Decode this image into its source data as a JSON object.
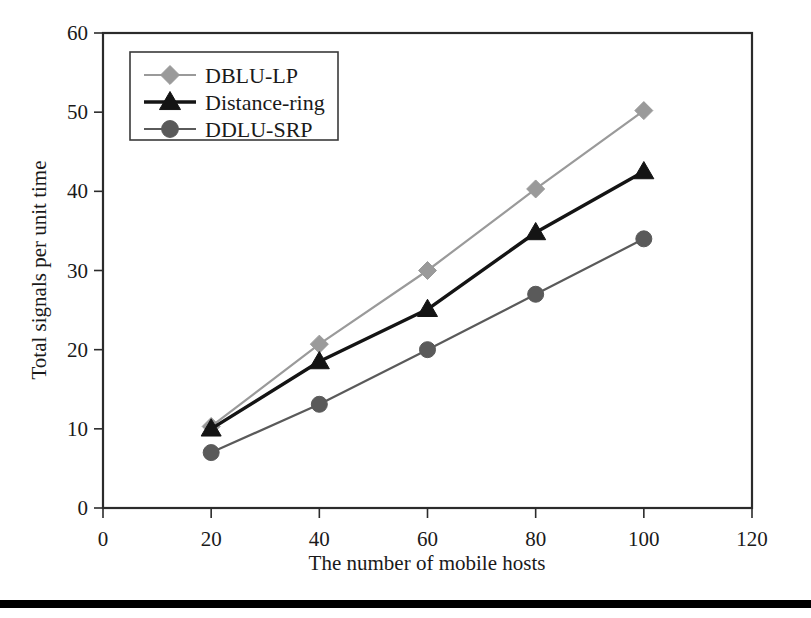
{
  "chart_data": {
    "type": "line",
    "title": "",
    "xlabel": "The number of mobile hosts",
    "ylabel": "Total signals per unit time",
    "x": [
      20,
      40,
      60,
      80,
      100
    ],
    "xlim": [
      0,
      120
    ],
    "ylim": [
      0,
      60
    ],
    "xticks": [
      "0",
      "20",
      "40",
      "60",
      "80",
      "100",
      "120"
    ],
    "xtick_values": [
      0,
      20,
      40,
      60,
      80,
      100,
      120
    ],
    "yticks": [
      "0",
      "10",
      "20",
      "30",
      "40",
      "50",
      "60"
    ],
    "ytick_values": [
      0,
      10,
      20,
      30,
      40,
      50,
      60
    ],
    "grid": false,
    "legend_position": "upper-left",
    "series": [
      {
        "name": "DBLU-LP",
        "values": [
          10.3,
          20.7,
          30.0,
          40.3,
          50.2
        ],
        "color": "#9a9a9a",
        "marker": "diamond"
      },
      {
        "name": "Distance-ring",
        "values": [
          10.0,
          18.5,
          25.1,
          34.8,
          42.5
        ],
        "color": "#141414",
        "marker": "triangle"
      },
      {
        "name": "DDLU-SRP",
        "values": [
          7.0,
          13.1,
          20.0,
          27.0,
          34.0
        ],
        "color": "#5a5a5a",
        "marker": "circle"
      }
    ]
  },
  "legend": {
    "entries": [
      {
        "label": "DBLU-LP"
      },
      {
        "label": "Distance-ring"
      },
      {
        "label": "DDLU-SRP"
      }
    ]
  },
  "axes": {
    "x_title": "The number of mobile hosts",
    "y_title": "Total signals per unit time"
  }
}
